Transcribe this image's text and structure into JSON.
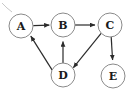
{
  "figure": {
    "type": "directed-graph",
    "background_color": "#ffffff",
    "node_fill": "#ffffff",
    "node_stroke": "#8a8a8a",
    "edge_color": "#2b2b2b",
    "label_color": "#1a1a1a",
    "width": 132,
    "height": 91
  },
  "nodes": [
    {
      "id": "A",
      "label": "A",
      "cx": 21,
      "cy": 26,
      "r": 12
    },
    {
      "id": "B",
      "label": "B",
      "cx": 63,
      "cy": 25,
      "r": 12
    },
    {
      "id": "C",
      "label": "C",
      "cx": 110,
      "cy": 25,
      "r": 12
    },
    {
      "id": "D",
      "label": "D",
      "cx": 63,
      "cy": 75,
      "r": 12
    },
    {
      "id": "E",
      "label": "E",
      "cx": 113,
      "cy": 76,
      "r": 12
    }
  ],
  "edges": [
    {
      "id": "a-to-b",
      "from": "A",
      "to": "B",
      "directed": true
    },
    {
      "id": "b-to-c",
      "from": "B",
      "to": "C",
      "directed": true
    },
    {
      "id": "c-to-d",
      "from": "C",
      "to": "D",
      "directed": true
    },
    {
      "id": "c-to-e",
      "from": "C",
      "to": "E",
      "directed": true
    },
    {
      "id": "d-to-a",
      "from": "D",
      "to": "A",
      "directed": true
    },
    {
      "id": "d-to-b",
      "from": "D",
      "to": "B",
      "directed": true
    }
  ]
}
